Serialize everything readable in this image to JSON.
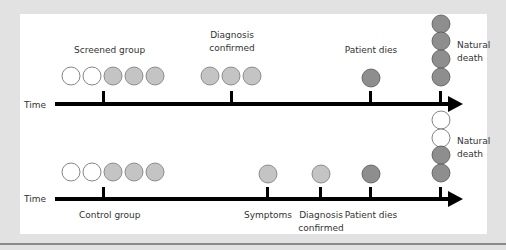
{
  "colors": {
    "background": "#e2e2e2",
    "panel": "#ffffff",
    "line": "#000000",
    "empty": "#ffffff",
    "light": "#c4c4c4",
    "dark": "#8e8e8e",
    "stroke": "#666666",
    "text": "#333333"
  },
  "screened": {
    "axis_label": "Time",
    "group_label": "Screened group",
    "diagnosis_label_1": "Diagnosis",
    "diagnosis_label_2": "confirmed",
    "dies_label": "Patient dies",
    "natural_label_1": "Natural",
    "natural_label_2": "death"
  },
  "control": {
    "axis_label": "Time",
    "group_label": "Control group",
    "symptoms_label": "Symptoms",
    "diagnosis_label_1": "Diagnosis",
    "diagnosis_label_2": "confirmed",
    "dies_label": "Patient dies",
    "natural_label_1": "Natural",
    "natural_label_2": "death"
  }
}
